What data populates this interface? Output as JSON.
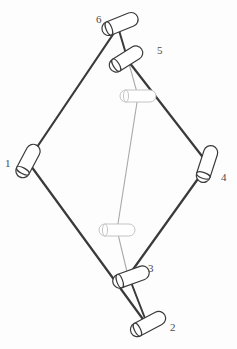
{
  "figure": {
    "kind": "mechanical-linkage-diagram",
    "background_color": "#fdfdfd",
    "link_color": "#3a3a3c",
    "secondary_link_color": "#a9a9ac",
    "joint_outline_color": "#3a3a3c",
    "secondary_joint_outline_color": "#bdbdc0",
    "joint_fill_color": "#ffffff",
    "label_color": "#4a4a4a"
  },
  "joints": [
    {
      "id": "1",
      "label": "1",
      "cx": 28,
      "cy": 161,
      "angle": -62,
      "length": 22,
      "radius": 7,
      "style": "primary",
      "label_x": 5,
      "label_y": 158
    },
    {
      "id": "2",
      "label": "2",
      "cx": 148,
      "cy": 324,
      "angle": -28,
      "length": 24,
      "radius": 7,
      "style": "primary",
      "label_x": 170,
      "label_y": 322
    },
    {
      "id": "3",
      "label": "3",
      "cx": 131,
      "cy": 277,
      "angle": -20,
      "length": 24,
      "radius": 7,
      "style": "primary",
      "label_x": 148,
      "label_y": 263
    },
    {
      "id": "4",
      "label": "4",
      "cx": 207,
      "cy": 164,
      "angle": -72,
      "length": 24,
      "radius": 7,
      "style": "primary",
      "label_x": 221,
      "label_y": 172
    },
    {
      "id": "5",
      "label": "5",
      "cx": 126,
      "cy": 59,
      "angle": -32,
      "length": 23,
      "radius": 7,
      "style": "primary",
      "label_x": 157,
      "label_y": 45
    },
    {
      "id": "6",
      "label": "6",
      "cx": 120,
      "cy": 24,
      "angle": -22,
      "length": 24,
      "radius": 7,
      "style": "primary",
      "label_x": 96,
      "label_y": 14
    },
    {
      "id": "7",
      "label": "",
      "cx": 138,
      "cy": 96,
      "angle": 0,
      "length": 24,
      "radius": 6,
      "style": "secondary",
      "label_x": 0,
      "label_y": 0
    },
    {
      "id": "8",
      "label": "",
      "cx": 117,
      "cy": 230,
      "angle": 0,
      "length": 24,
      "radius": 6,
      "style": "secondary",
      "label_x": 0,
      "label_y": 0
    }
  ],
  "links": [
    {
      "id": "link-6-1",
      "from": "6",
      "to": "1",
      "x1": 118,
      "y1": 27,
      "x2": 31,
      "y2": 156,
      "style": "primary",
      "width": 2.2
    },
    {
      "id": "link-6-5",
      "from": "6",
      "to": "5",
      "x1": 118,
      "y1": 27,
      "x2": 129,
      "y2": 64,
      "style": "primary",
      "width": 2.0
    },
    {
      "id": "link-5-4",
      "from": "5",
      "to": "4",
      "x1": 129,
      "y1": 62,
      "x2": 205,
      "y2": 160,
      "style": "primary",
      "width": 2.2
    },
    {
      "id": "link-4-3",
      "from": "4",
      "to": "3",
      "x1": 205,
      "y1": 169,
      "x2": 129,
      "y2": 275,
      "style": "primary",
      "width": 2.2
    },
    {
      "id": "link-3-2",
      "from": "3",
      "to": "2",
      "x1": 129,
      "y1": 277,
      "x2": 146,
      "y2": 321,
      "style": "primary",
      "width": 2.0
    },
    {
      "id": "link-1-2",
      "from": "1",
      "to": "2",
      "x1": 31,
      "y1": 166,
      "x2": 145,
      "y2": 322,
      "style": "primary",
      "width": 2.2
    },
    {
      "id": "link-5-3",
      "from": "5",
      "to": "3",
      "x1": 128,
      "y1": 60,
      "x2": 128,
      "y2": 276,
      "style": "secondary",
      "width": 1.1
    }
  ],
  "secondary_path": {
    "id": "coupler-path",
    "points": "128,60 138,96 117,230 128,276"
  }
}
